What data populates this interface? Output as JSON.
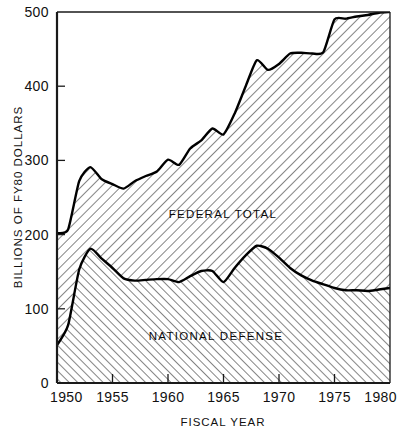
{
  "chart_data": {
    "type": "area",
    "title": "",
    "xlabel": "FISCAL YEAR",
    "ylabel": "BILLIONS OF FY80 DOLLARS",
    "xlim": [
      1950,
      1980
    ],
    "ylim": [
      0,
      500
    ],
    "xticks": [
      1950,
      1955,
      1960,
      1965,
      1970,
      1975,
      1980
    ],
    "xtick_labels": [
      "1950",
      "1955",
      "1960",
      "1965",
      "1970",
      "1975",
      "1980"
    ],
    "yticks": [
      0,
      100,
      200,
      300,
      400,
      500
    ],
    "ytick_labels": [
      "0",
      "100",
      "200",
      "300",
      "400",
      "500"
    ],
    "grid": false,
    "legend_position": "inline-annotation",
    "x": [
      1950,
      1951,
      1952,
      1953,
      1954,
      1955,
      1956,
      1957,
      1958,
      1959,
      1960,
      1961,
      1962,
      1963,
      1964,
      1965,
      1966,
      1967,
      1968,
      1969,
      1970,
      1971,
      1972,
      1973,
      1974,
      1975,
      1976,
      1977,
      1978,
      1979,
      1980
    ],
    "series": [
      {
        "name": "FEDERAL TOTAL",
        "label": "FEDERAL TOTAL",
        "fill": "hatch-backward",
        "values": [
          202,
          207,
          272,
          291,
          275,
          268,
          262,
          272,
          279,
          285,
          301,
          294,
          316,
          327,
          343,
          335,
          363,
          400,
          435,
          422,
          430,
          444,
          445,
          444,
          446,
          490,
          491,
          494,
          496,
          499,
          500
        ]
      },
      {
        "name": "NATIONAL DEFENSE",
        "label": "NATIONAL DEFENSE",
        "fill": "hatch-forward",
        "values": [
          51,
          78,
          153,
          181,
          168,
          155,
          141,
          138,
          139,
          140,
          140,
          136,
          144,
          151,
          151,
          136,
          155,
          172,
          185,
          181,
          169,
          155,
          145,
          138,
          133,
          128,
          125,
          125,
          124,
          126,
          128
        ]
      }
    ],
    "annotations": [
      {
        "text": "FEDERAL TOTAL",
        "x": 1963.5,
        "y": 243
      },
      {
        "text": "NATIONAL DEFENSE",
        "x": 1962.5,
        "y": 73
      }
    ]
  },
  "colors": {
    "ink": "#111111",
    "curve": "#000000",
    "background": "#ffffff"
  }
}
